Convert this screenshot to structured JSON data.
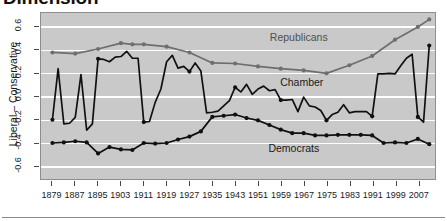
{
  "figure": {
    "title": "Dimension",
    "ylabel": "Liberal – Conservative"
  },
  "labels": {
    "republicans": "Republicans",
    "chamber": "Chamber",
    "democrats": "Democrats"
  },
  "colors": {
    "republican_line": "#6e6e6e",
    "chamber_line": "#101010",
    "democrat_line": "#101010",
    "plot_background": "#c9c9c9",
    "gridline": "#ffffff",
    "axis": "#4a4a4a"
  },
  "chart_data": {
    "type": "line",
    "title": "Dimension",
    "xlabel": "",
    "ylabel": "Liberal – Conservative",
    "xlim": [
      1875,
      2013
    ],
    "ylim": [
      -0.72,
      0.72
    ],
    "yticks": [
      -0.6,
      -0.4,
      -0.2,
      0.0,
      0.2,
      0.4,
      0.6
    ],
    "ytick_labels": [
      "-0.6",
      "-0.4",
      "-0.2",
      "0.0",
      "0.2",
      "0.4",
      "0.6"
    ],
    "xticks": [
      1879,
      1887,
      1895,
      1903,
      1911,
      1919,
      1927,
      1935,
      1943,
      1951,
      1959,
      1967,
      1975,
      1983,
      1991,
      1999,
      2007
    ],
    "xtick_labels": [
      "1879",
      "1887",
      "1895",
      "1903",
      "1911",
      "1919",
      "1927",
      "1935",
      "1943",
      "1951",
      "1959",
      "1967",
      "1975",
      "1983",
      "1991",
      "1999",
      "2007"
    ],
    "grid": true,
    "legend": "in-plot annotations",
    "series": [
      {
        "name": "Republicans",
        "color": "#6e6e6e",
        "markers": true,
        "x": [
          1879,
          1887,
          1895,
          1903,
          1907,
          1911,
          1919,
          1927,
          1935,
          1943,
          1951,
          1959,
          1967,
          1975,
          1983,
          1991,
          1999,
          2007,
          2011
        ],
        "y": [
          0.38,
          0.37,
          0.41,
          0.46,
          0.45,
          0.45,
          0.43,
          0.38,
          0.29,
          0.285,
          0.26,
          0.24,
          0.225,
          0.2,
          0.27,
          0.35,
          0.49,
          0.6,
          0.665
        ]
      },
      {
        "name": "Chamber",
        "color": "#101010",
        "markers": true,
        "x": [
          1879,
          1881,
          1883,
          1885,
          1887,
          1889,
          1891,
          1893,
          1895,
          1897,
          1899,
          1901,
          1903,
          1905,
          1907,
          1909,
          1911,
          1913,
          1915,
          1917,
          1919,
          1921,
          1923,
          1925,
          1927,
          1929,
          1931,
          1933,
          1935,
          1937,
          1939,
          1941,
          1943,
          1945,
          1947,
          1949,
          1951,
          1953,
          1955,
          1957,
          1959,
          1961,
          1963,
          1965,
          1967,
          1969,
          1971,
          1973,
          1975,
          1977,
          1979,
          1981,
          1983,
          1985,
          1987,
          1989,
          1991,
          1993,
          1995,
          1997,
          1999,
          2001,
          2003,
          2005,
          2007,
          2009,
          2011
        ],
        "y": [
          -0.2,
          0.24,
          -0.235,
          -0.23,
          -0.18,
          0.19,
          -0.29,
          -0.235,
          0.325,
          0.32,
          0.3,
          0.34,
          0.345,
          0.39,
          0.33,
          0.33,
          -0.22,
          -0.215,
          -0.05,
          0.065,
          0.3,
          0.355,
          0.245,
          0.26,
          0.215,
          0.29,
          0.22,
          -0.14,
          -0.135,
          -0.125,
          -0.08,
          -0.035,
          0.08,
          0.04,
          0.105,
          0.02,
          0.065,
          0.09,
          0.05,
          0.06,
          -0.03,
          -0.03,
          -0.025,
          -0.13,
          -0.005,
          -0.08,
          -0.09,
          -0.12,
          -0.205,
          -0.155,
          -0.135,
          -0.07,
          -0.14,
          -0.13,
          -0.13,
          -0.13,
          -0.17,
          0.195,
          0.195,
          0.2,
          0.195,
          0.265,
          0.33,
          0.365,
          -0.175,
          -0.22,
          0.44
        ]
      },
      {
        "name": "Democrats",
        "color": "#101010",
        "markers": true,
        "x": [
          1879,
          1883,
          1887,
          1891,
          1895,
          1899,
          1903,
          1907,
          1911,
          1915,
          1919,
          1923,
          1927,
          1931,
          1935,
          1939,
          1943,
          1947,
          1951,
          1955,
          1959,
          1963,
          1967,
          1971,
          1975,
          1979,
          1983,
          1987,
          1991,
          1995,
          1999,
          2003,
          2007,
          2011
        ],
        "y": [
          -0.4,
          -0.395,
          -0.385,
          -0.395,
          -0.49,
          -0.435,
          -0.455,
          -0.46,
          -0.4,
          -0.405,
          -0.4,
          -0.37,
          -0.345,
          -0.3,
          -0.175,
          -0.165,
          -0.155,
          -0.185,
          -0.205,
          -0.245,
          -0.285,
          -0.315,
          -0.315,
          -0.335,
          -0.335,
          -0.33,
          -0.33,
          -0.33,
          -0.335,
          -0.4,
          -0.395,
          -0.4,
          -0.365,
          -0.41
        ]
      }
    ]
  }
}
